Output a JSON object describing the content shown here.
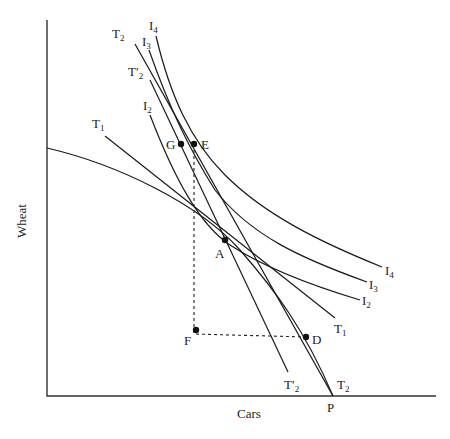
{
  "diagram": {
    "axes": {
      "y_label": "Wheat",
      "x_label": "Cars"
    },
    "points": {
      "A": "A",
      "D": "D",
      "E": "E",
      "F": "F",
      "G": "G",
      "P": "P"
    },
    "curves": {
      "I2": {
        "main": "I",
        "sub": "2"
      },
      "I3": {
        "main": "I",
        "sub": "3"
      },
      "I4": {
        "main": "I",
        "sub": "4"
      },
      "T1": {
        "main": "T",
        "sub": "1"
      },
      "T2": {
        "main": "T",
        "sub": "2"
      },
      "T2prime": {
        "main": "T′",
        "sub": "2"
      }
    }
  }
}
